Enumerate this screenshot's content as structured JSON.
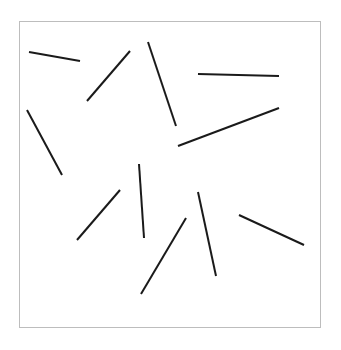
{
  "canvas": {
    "width": 341,
    "height": 350,
    "background": "#ffffff"
  },
  "frame": {
    "x": 19,
    "y": 21,
    "width": 301,
    "height": 306,
    "stroke": "#bdbdbd"
  },
  "line_style": {
    "stroke": "#1a1a1a",
    "width": 2
  },
  "lines": [
    {
      "x1": 29,
      "y1": 52,
      "x2": 80,
      "y2": 61
    },
    {
      "x1": 87,
      "y1": 101,
      "x2": 130,
      "y2": 51
    },
    {
      "x1": 148,
      "y1": 42,
      "x2": 176,
      "y2": 126
    },
    {
      "x1": 198,
      "y1": 74,
      "x2": 279,
      "y2": 76
    },
    {
      "x1": 178,
      "y1": 146,
      "x2": 279,
      "y2": 108
    },
    {
      "x1": 27,
      "y1": 110,
      "x2": 62,
      "y2": 175
    },
    {
      "x1": 139,
      "y1": 164,
      "x2": 144,
      "y2": 238
    },
    {
      "x1": 120,
      "y1": 190,
      "x2": 77,
      "y2": 240
    },
    {
      "x1": 186,
      "y1": 218,
      "x2": 141,
      "y2": 294
    },
    {
      "x1": 198,
      "y1": 192,
      "x2": 216,
      "y2": 276
    },
    {
      "x1": 239,
      "y1": 215,
      "x2": 304,
      "y2": 245
    }
  ]
}
